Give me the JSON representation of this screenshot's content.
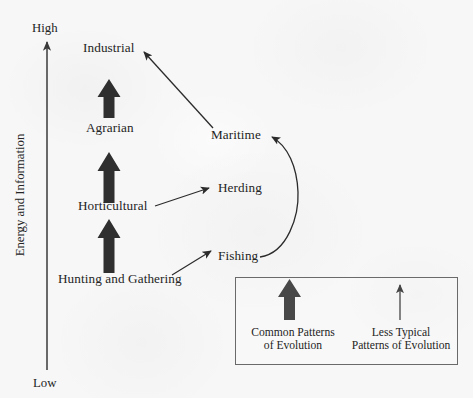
{
  "figure": {
    "type": "diagram",
    "kind": "sociocultural-evolution-flow-diagram",
    "background_color": "#f7f7f7",
    "ink_color": "#242424"
  },
  "axis": {
    "title": "Energy and Information",
    "high_label": "High",
    "low_label": "Low",
    "orientation": "vertical",
    "arrow_direction": "up"
  },
  "nodes": [
    {
      "id": "industrial",
      "label": "Industrial",
      "column": "left",
      "level": "high"
    },
    {
      "id": "agrarian",
      "label": "Agrarian",
      "column": "left",
      "level": "mid-high"
    },
    {
      "id": "horticultural",
      "label": "Horticultural",
      "column": "left",
      "level": "mid-low"
    },
    {
      "id": "hunting",
      "label": "Hunting and Gathering",
      "column": "left",
      "level": "low"
    },
    {
      "id": "maritime",
      "label": "Maritime",
      "column": "right",
      "level": "mid-high"
    },
    {
      "id": "herding",
      "label": "Herding",
      "column": "right",
      "level": "mid"
    },
    {
      "id": "fishing",
      "label": "Fishing",
      "column": "right",
      "level": "low"
    }
  ],
  "edges": [
    {
      "from": "hunting",
      "to": "horticultural",
      "style": "thick",
      "kind": "common-pattern"
    },
    {
      "from": "horticultural",
      "to": "agrarian",
      "style": "thick",
      "kind": "common-pattern"
    },
    {
      "from": "agrarian",
      "to": "industrial",
      "style": "thick",
      "kind": "common-pattern"
    },
    {
      "from": "hunting",
      "to": "fishing",
      "style": "thin",
      "kind": "less-typical-pattern"
    },
    {
      "from": "horticultural",
      "to": "herding",
      "style": "thin",
      "kind": "less-typical-pattern"
    },
    {
      "from": "fishing",
      "to": "maritime",
      "style": "thin-curved",
      "kind": "less-typical-pattern"
    },
    {
      "from": "maritime",
      "to": "industrial",
      "style": "thin",
      "kind": "less-typical-pattern"
    }
  ],
  "legend": {
    "items": [
      {
        "id": "common",
        "arrow_style": "thick",
        "caption": "Common Patterns\nof Evolution"
      },
      {
        "id": "less-typical",
        "arrow_style": "thin",
        "caption": "Less Typical\nPatterns of Evolution"
      }
    ]
  }
}
